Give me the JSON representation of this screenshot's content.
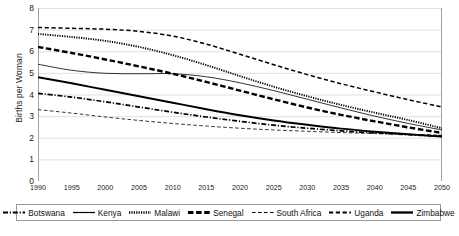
{
  "axes": {
    "ylabel": "Births per Woman",
    "yticks": [
      "0",
      "1",
      "2",
      "3",
      "4",
      "5",
      "6",
      "7",
      "8"
    ],
    "xticks": [
      "1990",
      "1995",
      "2000",
      "2005",
      "2010",
      "2015",
      "2020",
      "2025",
      "2030",
      "2035",
      "2040",
      "2045",
      "2050"
    ]
  },
  "legend": {
    "items": [
      {
        "label": "Botswana",
        "style": "dash-dot"
      },
      {
        "label": "Kenya",
        "style": "thin-solid"
      },
      {
        "label": "Malawi",
        "style": "dotted"
      },
      {
        "label": "Senegal",
        "style": "thick-dashed"
      },
      {
        "label": "South Africa",
        "style": "thin-dashed"
      },
      {
        "label": "Uganda",
        "style": "medium-dashed"
      },
      {
        "label": "Zimbabwe",
        "style": "thick-solid"
      }
    ]
  },
  "chart_data": {
    "type": "line",
    "title": "",
    "xlabel": "",
    "ylabel": "Births per Woman",
    "xlim": [
      1990,
      2050
    ],
    "ylim": [
      0,
      8
    ],
    "grid": true,
    "legend_position": "bottom",
    "x": [
      1990,
      1995,
      2000,
      2005,
      2010,
      2015,
      2020,
      2025,
      2030,
      2035,
      2040,
      2045,
      2050
    ],
    "series": [
      {
        "name": "Uganda",
        "style": "medium-dashed",
        "color": "#000000",
        "values": [
          7.1,
          7.06,
          7.02,
          6.92,
          6.7,
          6.33,
          5.86,
          5.38,
          4.92,
          4.5,
          4.12,
          3.76,
          3.42
        ]
      },
      {
        "name": "Malawi",
        "style": "dotted",
        "color": "#000000",
        "values": [
          6.8,
          6.66,
          6.48,
          6.2,
          5.82,
          5.36,
          4.85,
          4.36,
          3.92,
          3.52,
          3.16,
          2.82,
          2.44
        ]
      },
      {
        "name": "Senegal",
        "style": "thick-dashed",
        "color": "#000000",
        "values": [
          6.2,
          5.92,
          5.62,
          5.3,
          4.96,
          4.58,
          4.18,
          3.78,
          3.4,
          3.06,
          2.76,
          2.48,
          2.22
        ]
      },
      {
        "name": "Kenya",
        "style": "thin-solid",
        "color": "#000000",
        "values": [
          5.4,
          5.12,
          4.98,
          4.96,
          4.96,
          4.82,
          4.54,
          4.18,
          3.78,
          3.38,
          3.0,
          2.66,
          2.36
        ]
      },
      {
        "name": "Zimbabwe",
        "style": "thick-solid",
        "color": "#000000",
        "values": [
          4.8,
          4.52,
          4.22,
          3.92,
          3.62,
          3.32,
          3.04,
          2.8,
          2.6,
          2.42,
          2.28,
          2.16,
          2.06
        ]
      },
      {
        "name": "Botswana",
        "style": "dash-dot",
        "color": "#000000",
        "values": [
          4.05,
          3.88,
          3.66,
          3.42,
          3.18,
          2.96,
          2.76,
          2.58,
          2.44,
          2.32,
          2.22,
          2.14,
          2.06
        ]
      },
      {
        "name": "South Africa",
        "style": "thin-dashed",
        "color": "#000000",
        "values": [
          3.3,
          3.14,
          2.96,
          2.8,
          2.66,
          2.54,
          2.44,
          2.36,
          2.3,
          2.24,
          2.2,
          2.16,
          2.12
        ]
      }
    ]
  }
}
